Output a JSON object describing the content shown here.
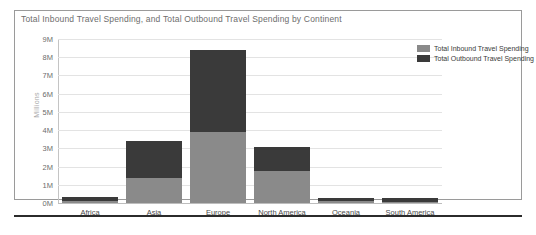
{
  "chart_data": {
    "type": "bar",
    "subtype": "stacked-column",
    "title": "Total Inbound Travel Spending, and Total Outbound Travel Spending by Continent",
    "xlabel": "",
    "ylabel": "Millions",
    "ylim": [
      0,
      9000000
    ],
    "grid": true,
    "legend_position": "right",
    "categories": [
      "Africa",
      "Asia",
      "Europe",
      "North America",
      "Oceania",
      "South America"
    ],
    "ytick_labels": [
      "9M",
      "8M",
      "7M",
      "6M",
      "5M",
      "4M",
      "3M",
      "2M",
      "1M",
      "0M"
    ],
    "ytick_values": [
      9000000,
      8000000,
      7000000,
      6000000,
      5000000,
      4000000,
      3000000,
      2000000,
      1000000,
      0
    ],
    "series": [
      {
        "name": "Total Inbound Travel Spending",
        "color": "#8a8a8a",
        "values": [
          100000,
          1400000,
          3900000,
          1750000,
          100000,
          50000
        ]
      },
      {
        "name": "Total Outbound Travel Spending",
        "color": "#3a3a3a",
        "values": [
          250000,
          2000000,
          4500000,
          1350000,
          200000,
          200000
        ]
      }
    ],
    "totals": [
      350000,
      3400000,
      8400000,
      3100000,
      300000,
      250000
    ]
  },
  "legend": {
    "items": [
      {
        "label": "Total Inbound Travel Spending",
        "color": "#8a8a8a"
      },
      {
        "label": "Total Outbound Travel Spending",
        "color": "#3a3a3a"
      }
    ]
  }
}
